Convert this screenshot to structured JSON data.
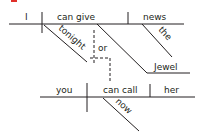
{
  "diagram": {
    "type": "sentence-diagram",
    "marker_color": "#e0302a",
    "line_color": "#231f20",
    "clause1": {
      "subject": "I",
      "verb": "can give",
      "direct_object": "news",
      "modifiers": {
        "verb_adverb": "tonight",
        "object_article": "the"
      },
      "indirect_object": "Jewel"
    },
    "conjunction": "or",
    "clause2": {
      "subject": "you",
      "verb": "can call",
      "direct_object": "her",
      "modifiers": {
        "verb_adverb": "now"
      }
    }
  }
}
